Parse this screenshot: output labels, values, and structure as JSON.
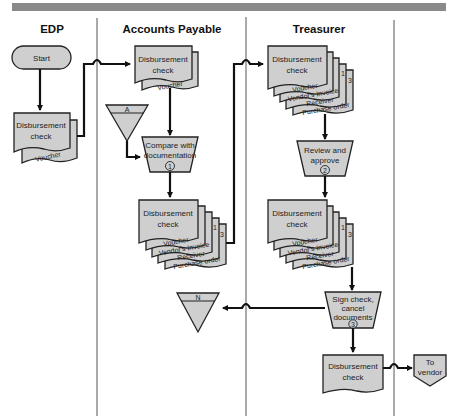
{
  "header_bar_color": "#8a8a8a",
  "shape_fill": "#cfcfcf",
  "lanes": [
    {
      "title": "EDP"
    },
    {
      "title": "Accounts Payable"
    },
    {
      "title": "Treasurer"
    },
    {
      "title": ""
    }
  ],
  "edp": {
    "start": "Start",
    "doc_line1": "Disbursement",
    "doc_line2": "check",
    "doc_copy": "Voucher"
  },
  "ap": {
    "doc_line1": "Disbursement",
    "doc_line2": "check",
    "doc_copy": "Voucher",
    "file_a": "A",
    "process1_line1": "Compare with",
    "process1_line2": "documentation",
    "process1_num": "1",
    "bundle_line1": "Disbursement",
    "bundle_line2": "check",
    "bundle_copies": [
      "Voucher",
      "Vendor's Invoice",
      "Receiver",
      "Purchase order"
    ],
    "bundle_num1": "1",
    "bundle_num3": "3",
    "file_n": "N"
  },
  "treasurer": {
    "bundle1_line1": "Disbursement",
    "bundle1_line2": "check",
    "bundle1_copies": [
      "Voucher",
      "Vendor's Invoice",
      "Receiver",
      "Purchase order"
    ],
    "bundle1_num1": "1",
    "bundle1_num3": "3",
    "process2_line1": "Review and",
    "process2_line2": "approve",
    "process2_num": "2",
    "bundle2_line1": "Disbursement",
    "bundle2_line2": "check",
    "bundle2_copies": [
      "Voucher",
      "Vendor's Invoice",
      "Receiver",
      "Purchase order"
    ],
    "bundle2_num1": "1",
    "bundle2_num3": "3",
    "process3_line1": "Sign check,",
    "process3_line2": "cancel",
    "process3_line3": "documents",
    "process3_num": "3",
    "final_line1": "Disbursement",
    "final_line2": "check"
  },
  "offpage": {
    "line1": "To",
    "line2": "vendor"
  }
}
